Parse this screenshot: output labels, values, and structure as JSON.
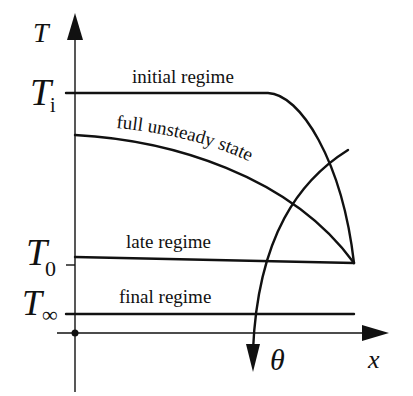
{
  "figure": {
    "axes": {
      "y_label": "T",
      "x_label": "x",
      "origin_marker": "dot"
    },
    "y_ticks": [
      {
        "symbol": "T",
        "subscript": "i",
        "meaning": "initial temperature"
      },
      {
        "symbol": "T",
        "subscript": "0",
        "meaning": "surface/boundary temperature"
      },
      {
        "symbol": "T",
        "subscript": "∞",
        "meaning": "ambient temperature"
      }
    ],
    "curves": [
      {
        "label": "initial regime"
      },
      {
        "label": "full unsteady state"
      },
      {
        "label": "late regime"
      },
      {
        "label": "final regime"
      }
    ],
    "time_arrow": {
      "label": "θ",
      "meaning": "direction of increasing time"
    }
  }
}
